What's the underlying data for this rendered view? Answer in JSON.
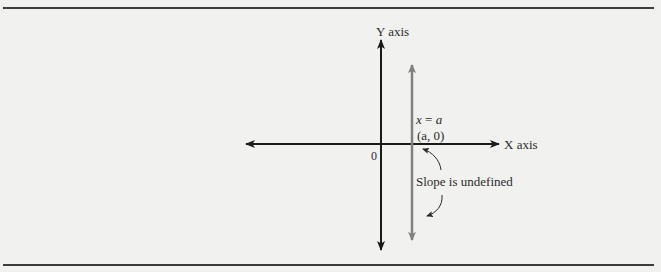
{
  "diagram": {
    "title": "",
    "axes": {
      "y_label": "Y axis",
      "x_label": "X axis",
      "origin_label": "0"
    },
    "vertical_line": {
      "equation_lhs": "x",
      "equation_eq": "=",
      "equation_rhs": "a",
      "point_label": "(a, 0)",
      "annotation": "Slope is undefined"
    },
    "colors": {
      "axis": "#1a1a1a",
      "vertical_line": "#808080",
      "rule": "#3d3d3d",
      "background": "#f1f1ef"
    }
  }
}
